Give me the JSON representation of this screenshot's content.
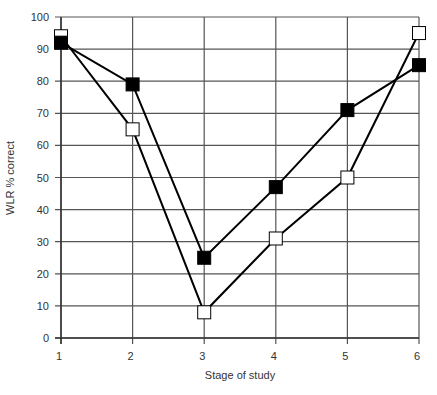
{
  "chart_data": {
    "type": "line",
    "title": "",
    "xlabel": "Stage of study",
    "ylabel": "WLR % correct",
    "x": [
      1,
      2,
      3,
      4,
      5,
      6
    ],
    "categories": [
      "1",
      "2",
      "3",
      "4",
      "5",
      "6"
    ],
    "xlim": [
      1,
      6
    ],
    "ylim": [
      0,
      100
    ],
    "yticks": [
      0,
      10,
      20,
      30,
      40,
      50,
      60,
      70,
      80,
      90,
      100
    ],
    "grid": true,
    "legend": null,
    "series": [
      {
        "name": "Filled squares",
        "marker": "filled-square",
        "color": "#000000",
        "values": [
          92,
          79,
          25,
          47,
          71,
          85
        ]
      },
      {
        "name": "Open squares",
        "marker": "open-square",
        "color": "#000000",
        "values": [
          94,
          65,
          8,
          31,
          50,
          95
        ]
      }
    ]
  }
}
